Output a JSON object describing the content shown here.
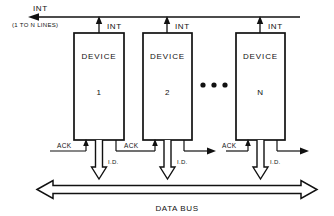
{
  "diagram": {
    "top_bus": {
      "label": "INT",
      "note": "(1 TO N LINES)",
      "direction": "left"
    },
    "devices": [
      {
        "name": "DEVICE",
        "number": "1",
        "int_label": "INT",
        "ack_label": "ACK",
        "id_label": "I.D."
      },
      {
        "name": "DEVICE",
        "number": "2",
        "int_label": "INT",
        "ack_label": "ACK",
        "id_label": "I.D."
      },
      {
        "name": "DEVICE",
        "number": "N",
        "int_label": "INT",
        "ack_label": "ACK",
        "id_label": "I.D."
      }
    ],
    "ellipsis": "•  •  •",
    "bottom_bus": {
      "label": "DATA BUS",
      "direction": "bidirectional"
    },
    "colors": {
      "line": "#111111",
      "background": "#ffffff",
      "fill": "#ffffff"
    }
  }
}
